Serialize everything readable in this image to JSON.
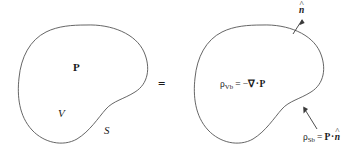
{
  "figure": {
    "background_color": "#ffffff",
    "stroke_color": "#555555",
    "text_color": "#1a1a1a",
    "width": 362,
    "height": 158
  },
  "left_region": {
    "name": "polarized-body",
    "labels": {
      "polarization": "P",
      "volume": "V",
      "surface": "S"
    }
  },
  "operator": {
    "equals": "="
  },
  "right_region": {
    "name": "bound-charge-body",
    "normal_vector_label": {
      "symbol": "n",
      "accent": "^"
    },
    "volume_formula": {
      "rho": "ρ",
      "subscript": "Vb",
      "equals": "=",
      "minus": "−",
      "nabla": "∇",
      "dot": "·",
      "vector": "P",
      "full_text": "ρVb = −∇·P"
    },
    "surface_formula": {
      "rho": "ρ",
      "subscript": "Sb",
      "equals": "=",
      "vector": "P",
      "dot": "·",
      "normal": "n",
      "accent": "^",
      "full_text": "ρSb = P·n̂"
    }
  }
}
